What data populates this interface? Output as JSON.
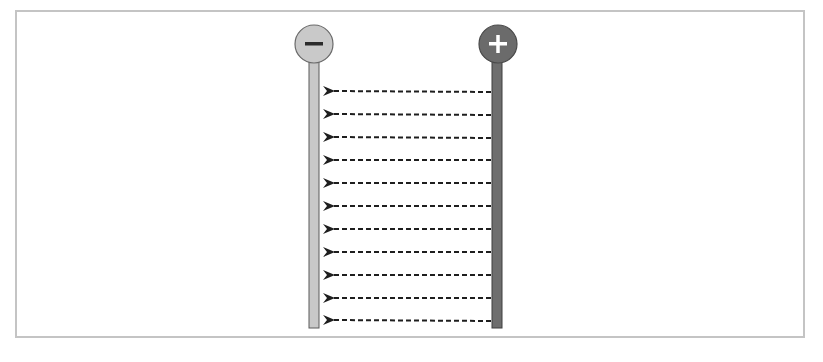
{
  "diagram": {
    "negative_electrode": {
      "symbol": "−",
      "label": "negative-terminal",
      "circle_fill": "#c9c9c9",
      "rod_fill": "#c8c8c8",
      "stroke": "#5a5a5a",
      "symbol_color": "#2b2b2b"
    },
    "positive_electrode": {
      "symbol": "+",
      "label": "positive-terminal",
      "circle_fill": "#6b6b6b",
      "rod_fill": "#6e6e6e",
      "stroke": "#3f3f3f",
      "symbol_color": "#ffffff"
    },
    "field_lines": {
      "count": 11,
      "direction": "positive-to-negative",
      "style": "dashed",
      "color": "#222222"
    },
    "frame_color": "#c4c4c4"
  }
}
